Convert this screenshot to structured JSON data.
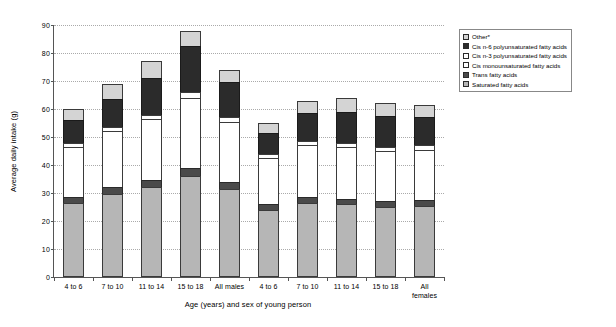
{
  "chart_data": {
    "type": "bar",
    "stacked": true,
    "title": "",
    "xlabel": "Age (years) and sex of young person",
    "ylabel": "Average daily intake (g)",
    "ylim": [
      0,
      90
    ],
    "ytick_step": 10,
    "yticks": [
      0,
      10,
      20,
      30,
      40,
      50,
      60,
      70,
      80,
      90
    ],
    "grid": true,
    "legend_position": "top-right",
    "categories": [
      "4 to 6",
      "7 to 10",
      "11 to 14",
      "15 to 18",
      "All males",
      "4 to 6",
      "7 to 10",
      "11 to 14",
      "15 to 18",
      "All females"
    ],
    "series": [
      {
        "name": "Saturated fatty acids",
        "key": "saturated",
        "color": "#b6b6b6",
        "values": [
          26.5,
          29.5,
          32.0,
          36.0,
          31.5,
          24.0,
          26.5,
          26.0,
          25.0,
          25.5
        ]
      },
      {
        "name": "Trans fatty acids",
        "key": "trans",
        "color": "#4a4a4a",
        "values": [
          2.0,
          2.5,
          2.5,
          3.0,
          2.5,
          2.0,
          2.0,
          2.0,
          2.0,
          2.0
        ]
      },
      {
        "name": "Cis monounsaturated fatty acids",
        "key": "cis-mono",
        "color": "#ffffff",
        "values": [
          18.0,
          20.0,
          22.0,
          25.0,
          21.5,
          16.5,
          18.5,
          18.5,
          18.0,
          18.0
        ]
      },
      {
        "name": "Cis n-3 polyunsaturated fatty acids",
        "key": "cis-n3",
        "color": "#ffffff",
        "values": [
          1.5,
          1.5,
          1.5,
          2.0,
          1.5,
          1.5,
          1.5,
          1.5,
          1.5,
          1.5
        ]
      },
      {
        "name": "Cis n-6 polyunsaturated fatty acids",
        "key": "cis-n6",
        "color": "#2b2b2b",
        "values": [
          8.0,
          10.0,
          13.0,
          16.5,
          12.5,
          7.5,
          10.0,
          11.0,
          11.0,
          10.0
        ]
      },
      {
        "name": "Other*",
        "key": "other",
        "color": "#d4d4d4",
        "values": [
          4.0,
          5.5,
          6.0,
          5.5,
          4.5,
          3.5,
          4.5,
          5.0,
          4.5,
          4.5
        ]
      }
    ],
    "totals": [
      60.0,
      69.0,
      77.0,
      88.0,
      74.0,
      55.0,
      63.0,
      64.0,
      62.0,
      61.5
    ]
  },
  "legend": {
    "items": [
      {
        "label": "Other*",
        "key": "other"
      },
      {
        "label": "Cis n-6 polyunsaturated fatty acids",
        "key": "cis-n6"
      },
      {
        "label": "Cis n-3 polyunsaturated fatty acids",
        "key": "cis-n3"
      },
      {
        "label": "Cis monounsaturated fatty acids",
        "key": "cis-mono"
      },
      {
        "label": "Trans fatty acids",
        "key": "trans"
      },
      {
        "label": "Saturated fatty acids",
        "key": "saturated"
      }
    ]
  }
}
